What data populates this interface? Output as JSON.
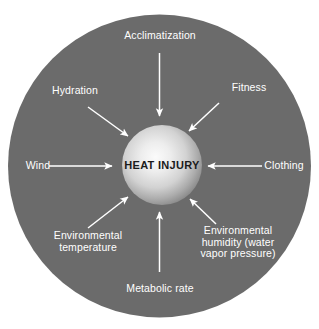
{
  "diagram": {
    "type": "radial-influence-diagram",
    "background_color": "#ffffff",
    "disc_color": "#6b6b6b",
    "arrow_color": "#ffffff",
    "label_color": "#ffffff",
    "center": {
      "label": "HEAT INJURY",
      "text_color": "#1b1b1b",
      "sphere_highlight_color": "#f2f2f2",
      "sphere_edge_color": "#8d8d8d"
    },
    "factors": [
      {
        "id": "acclimatization",
        "label": "Acclimatization",
        "position": "top",
        "arrow_direction": "down",
        "arrow_icon": "arrow-down-icon"
      },
      {
        "id": "fitness",
        "label": "Fitness",
        "position": "top-right",
        "arrow_direction": "down-left",
        "arrow_icon": "arrow-down-left-icon"
      },
      {
        "id": "clothing",
        "label": "Clothing",
        "position": "right",
        "arrow_direction": "left",
        "arrow_icon": "arrow-left-icon"
      },
      {
        "id": "environmental-humidity",
        "label": "Environmental\nhumidity (water\nvapor pressure)",
        "position": "bottom-right",
        "arrow_direction": "up-left",
        "arrow_icon": "arrow-up-left-icon"
      },
      {
        "id": "metabolic-rate",
        "label": "Metabolic rate",
        "position": "bottom",
        "arrow_direction": "up",
        "arrow_icon": "arrow-up-icon"
      },
      {
        "id": "environmental-temperature",
        "label": "Environmental\ntemperature",
        "position": "bottom-left",
        "arrow_direction": "up-right",
        "arrow_icon": "arrow-up-right-icon"
      },
      {
        "id": "wind",
        "label": "Wind",
        "position": "left",
        "arrow_direction": "right",
        "arrow_icon": "arrow-right-icon"
      },
      {
        "id": "hydration",
        "label": "Hydration",
        "position": "top-left",
        "arrow_direction": "down-right",
        "arrow_icon": "arrow-down-right-icon"
      }
    ]
  }
}
